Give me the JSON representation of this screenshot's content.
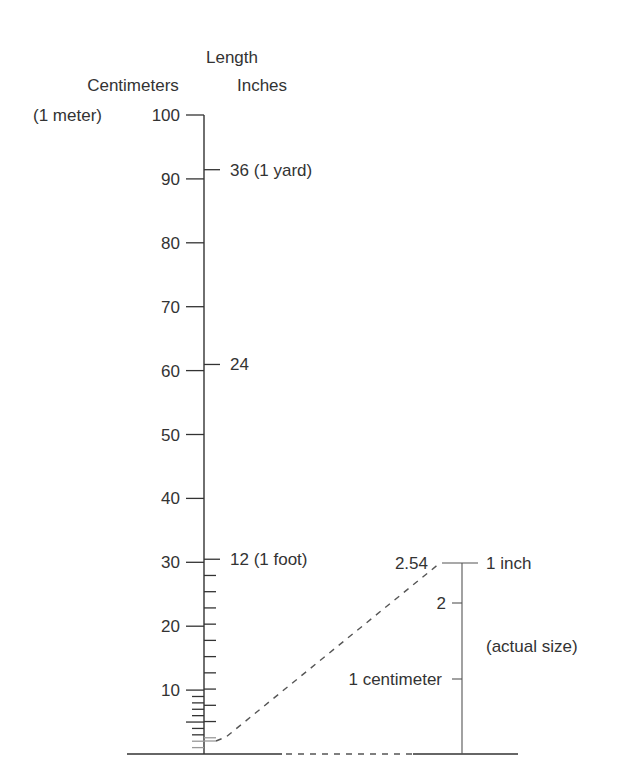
{
  "diagram": {
    "title": "Length",
    "left_scale_label": "Centimeters",
    "right_scale_label": "Inches",
    "top_left_note": "(1 meter)",
    "colors": {
      "ink": "#333333",
      "light": "#999999",
      "background": "#ffffff"
    },
    "cm_ticks": [
      {
        "value": 100,
        "label": "100"
      },
      {
        "value": 90,
        "label": "90"
      },
      {
        "value": 80,
        "label": "80"
      },
      {
        "value": 70,
        "label": "70"
      },
      {
        "value": 60,
        "label": "60"
      },
      {
        "value": 50,
        "label": "50"
      },
      {
        "value": 40,
        "label": "40"
      },
      {
        "value": 30,
        "label": "30"
      },
      {
        "value": 20,
        "label": "20"
      },
      {
        "value": 10,
        "label": "10"
      }
    ],
    "inch_ticks": [
      {
        "value": 36,
        "label": "36 (1 yard)"
      },
      {
        "value": 24,
        "label": "24"
      },
      {
        "value": 12,
        "label": "12 (1 foot)"
      }
    ],
    "inset": {
      "top_value_label": "2.54",
      "top_right_label": "1 inch",
      "tick_2_label": "2",
      "tick_1_label": "1 centimeter",
      "note": "(actual size)"
    }
  }
}
